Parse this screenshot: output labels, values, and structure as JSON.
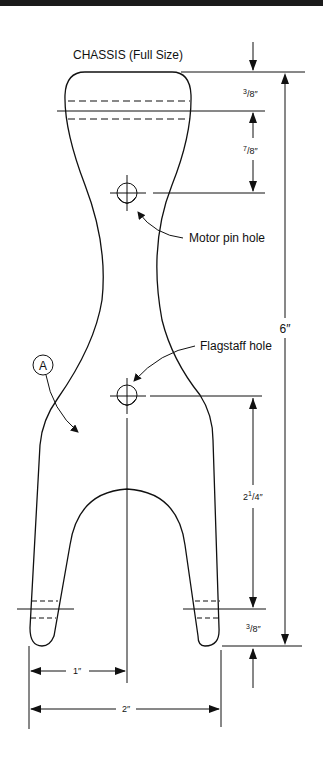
{
  "title": "CHASSIS (Full Size)",
  "callouts": {
    "motor_pin_hole": "Motor pin hole",
    "flagstaff_hole": "Flagstaff hole",
    "detail_marker": "A"
  },
  "dimensions": {
    "top_offset": {
      "num": "3",
      "den": "8",
      "unit": "″"
    },
    "motor_pin_offset": {
      "num": "7",
      "den": "8",
      "unit": "″"
    },
    "overall_height": "6″",
    "flagstaff_to_leg": {
      "whole": "2",
      "num": "1",
      "den": "4",
      "unit": "″"
    },
    "leg_end_offset": {
      "num": "3",
      "den": "8",
      "unit": "″"
    },
    "half_width": "1″",
    "full_width": "2″"
  },
  "colors": {
    "line": "#111111",
    "background": "#ffffff"
  }
}
